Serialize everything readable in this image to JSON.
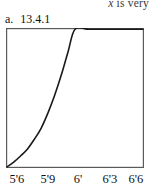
{
  "page": {
    "width": 151,
    "height": 194,
    "background": "#ffffff",
    "ink_color": "#1a1a1a"
  },
  "cut_text": {
    "italic_part": "x",
    "rest_part": " is very"
  },
  "caption": {
    "letter": "a.",
    "number": "13.4.1"
  },
  "chart_data": {
    "type": "line",
    "title": "",
    "subtitle": "",
    "xlabel": "",
    "ylabel": "",
    "grid": false,
    "legend": null,
    "frame": "box",
    "line_color": "#1a1a1a",
    "frame_color": "#555555",
    "xticklabels": [
      "5'6",
      "5'9",
      "6'",
      "6'3",
      "6'6"
    ],
    "xtick_positions": [
      0,
      0.25,
      0.5,
      0.75,
      1.0
    ],
    "yticklabels": [],
    "xlim": [
      "5'6",
      "6'6"
    ],
    "ylim": [
      0,
      1
    ],
    "x": [
      0.0,
      0.05,
      0.1,
      0.15,
      0.2,
      0.25,
      0.3,
      0.35,
      0.4,
      0.45,
      0.5,
      0.6,
      0.7,
      0.8,
      0.9,
      1.0
    ],
    "y": [
      0.0,
      0.035,
      0.08,
      0.13,
      0.2,
      0.28,
      0.39,
      0.52,
      0.67,
      0.84,
      1.0,
      1.0,
      1.0,
      1.0,
      1.0,
      1.0
    ],
    "annotations": []
  }
}
